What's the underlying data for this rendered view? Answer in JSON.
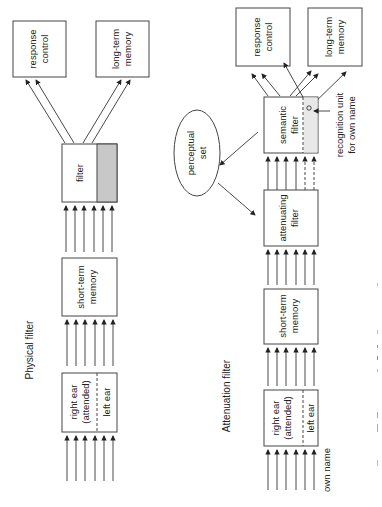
{
  "physical_filter": {
    "title": "Physical filter",
    "response_control": [
      "response",
      "control"
    ],
    "long_term_memory": [
      "long-term",
      "memory"
    ],
    "filter": "filter",
    "short_term_memory": [
      "short-term",
      "memory"
    ],
    "ears": {
      "attended": [
        "right ear",
        "(attended)"
      ],
      "unattended": "left ear"
    }
  },
  "attenuation_filter": {
    "title": "Attenuation filter",
    "response_control": [
      "response",
      "control"
    ],
    "long_term_memory": [
      "long-term",
      "memory"
    ],
    "semantic_filter": [
      "semantic",
      "filter"
    ],
    "recognition_unit": [
      "recognition unit",
      "for own name"
    ],
    "perceptual_set": [
      "perceptual",
      "set"
    ],
    "attenuating_filter": [
      "attenuating",
      "filter"
    ],
    "short_term_memory": [
      "short-term",
      "memory"
    ],
    "ears": {
      "attended": [
        "right ear",
        "(attended)"
      ],
      "unattended": "left ear"
    },
    "input_label": "own name"
  },
  "colors": {
    "filter_gray": "#c8c8c8",
    "semantic_gray": "#e8e8e8",
    "stroke": "#444444"
  }
}
